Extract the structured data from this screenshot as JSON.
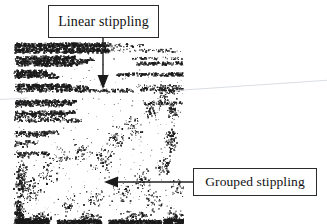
{
  "figure": {
    "width": 327,
    "height": 224,
    "background_color": "#ffffff",
    "ink_color": "#1a1a1a",
    "streak_color": "#d9dde2"
  },
  "annotations": [
    {
      "id": "linear",
      "label": "Linear stippling",
      "box": {
        "x": 48,
        "y": 5,
        "width": 111,
        "height": 33
      },
      "border_color": "#2b2b2b",
      "arrow": {
        "direction": "down",
        "from": {
          "x": 103,
          "y": 38
        },
        "to": {
          "x": 103,
          "y": 88
        }
      }
    },
    {
      "id": "grouped",
      "label": "Grouped stippling",
      "box": {
        "x": 193,
        "y": 168,
        "width": 124,
        "height": 28
      },
      "border_color": "#2b2b2b",
      "arrow": {
        "direction": "left",
        "from": {
          "x": 193,
          "y": 182
        },
        "to": {
          "x": 104,
          "y": 182
        }
      }
    }
  ],
  "scan": {
    "region": {
      "x": 12,
      "y": 39,
      "width": 172,
      "height": 185
    },
    "seed": 20240517,
    "linear_rows": [
      {
        "y": 3,
        "x": 2,
        "width": 96,
        "density": 0.5,
        "size": 1.5
      },
      {
        "y": 5,
        "x": 2,
        "width": 92,
        "density": 0.46,
        "size": 1.4
      },
      {
        "y": 8,
        "x": 2,
        "width": 99,
        "density": 0.52,
        "size": 1.5
      },
      {
        "y": 10,
        "x": 2,
        "width": 94,
        "density": 0.44,
        "size": 1.4
      },
      {
        "y": 4,
        "x": 101,
        "width": 30,
        "density": 0.16,
        "size": 1.2
      },
      {
        "y": 9,
        "x": 100,
        "width": 70,
        "density": 0.14,
        "size": 1.2
      },
      {
        "y": 16,
        "x": 2,
        "width": 60,
        "density": 0.48,
        "size": 1.5
      },
      {
        "y": 18,
        "x": 2,
        "width": 78,
        "density": 0.46,
        "size": 1.4
      },
      {
        "y": 21,
        "x": 2,
        "width": 72,
        "density": 0.5,
        "size": 1.5
      },
      {
        "y": 23,
        "x": 2,
        "width": 64,
        "density": 0.42,
        "size": 1.4
      },
      {
        "y": 17,
        "x": 118,
        "width": 52,
        "density": 0.18,
        "size": 1.2
      },
      {
        "y": 22,
        "x": 122,
        "width": 48,
        "density": 0.4,
        "size": 1.4
      },
      {
        "y": 30,
        "x": 2,
        "width": 32,
        "density": 0.5,
        "size": 1.5
      },
      {
        "y": 33,
        "x": 2,
        "width": 40,
        "density": 0.48,
        "size": 1.5
      },
      {
        "y": 35,
        "x": 2,
        "width": 44,
        "density": 0.4,
        "size": 1.3
      },
      {
        "y": 33,
        "x": 104,
        "width": 66,
        "density": 0.42,
        "size": 1.4
      },
      {
        "y": 44,
        "x": 2,
        "width": 56,
        "density": 0.48,
        "size": 1.5
      },
      {
        "y": 46,
        "x": 2,
        "width": 74,
        "density": 0.46,
        "size": 1.4
      },
      {
        "y": 49,
        "x": 2,
        "width": 120,
        "density": 0.34,
        "size": 1.3
      },
      {
        "y": 45,
        "x": 124,
        "width": 46,
        "density": 0.22,
        "size": 1.2
      },
      {
        "y": 48,
        "x": 128,
        "width": 42,
        "density": 0.4,
        "size": 1.4
      },
      {
        "y": 52,
        "x": 140,
        "width": 26,
        "density": 0.18,
        "size": 1.1
      },
      {
        "y": 60,
        "x": 2,
        "width": 62,
        "density": 0.46,
        "size": 1.4
      },
      {
        "y": 62,
        "x": 2,
        "width": 58,
        "density": 0.44,
        "size": 1.4
      },
      {
        "y": 64,
        "x": 2,
        "width": 48,
        "density": 0.3,
        "size": 1.2
      },
      {
        "y": 62,
        "x": 130,
        "width": 40,
        "density": 0.26,
        "size": 1.3
      },
      {
        "y": 71,
        "x": 2,
        "width": 60,
        "density": 0.42,
        "size": 1.4
      },
      {
        "y": 73,
        "x": 2,
        "width": 54,
        "density": 0.4,
        "size": 1.4
      },
      {
        "y": 76,
        "x": 2,
        "width": 50,
        "density": 0.26,
        "size": 1.2
      },
      {
        "y": 79,
        "x": 2,
        "width": 66,
        "density": 0.3,
        "size": 1.3
      },
      {
        "y": 91,
        "x": 2,
        "width": 44,
        "density": 0.4,
        "size": 1.4
      },
      {
        "y": 94,
        "x": 2,
        "width": 34,
        "density": 0.3,
        "size": 1.3
      },
      {
        "y": 101,
        "x": 2,
        "width": 22,
        "density": 0.34,
        "size": 1.3
      },
      {
        "y": 104,
        "x": 2,
        "width": 14,
        "density": 0.26,
        "size": 1.2
      },
      {
        "y": 112,
        "x": 2,
        "width": 34,
        "density": 0.38,
        "size": 1.4
      },
      {
        "y": 115,
        "x": 2,
        "width": 16,
        "density": 0.26,
        "size": 1.2
      }
    ],
    "clusters": [
      {
        "cx": 8,
        "cy": 140,
        "rx": 9,
        "ry": 28,
        "count": 150,
        "size": 1.3
      },
      {
        "cx": 6,
        "cy": 172,
        "rx": 8,
        "ry": 24,
        "count": 170,
        "size": 1.4
      },
      {
        "cx": 20,
        "cy": 150,
        "rx": 14,
        "ry": 20,
        "count": 70,
        "size": 1.2
      },
      {
        "cx": 34,
        "cy": 132,
        "rx": 18,
        "ry": 22,
        "count": 55,
        "size": 1.2
      },
      {
        "cx": 48,
        "cy": 118,
        "rx": 16,
        "ry": 16,
        "count": 40,
        "size": 1.2
      },
      {
        "cx": 68,
        "cy": 112,
        "rx": 18,
        "ry": 18,
        "count": 45,
        "size": 1.2
      },
      {
        "cx": 90,
        "cy": 120,
        "rx": 20,
        "ry": 22,
        "count": 60,
        "size": 1.3
      },
      {
        "cx": 104,
        "cy": 100,
        "rx": 16,
        "ry": 20,
        "count": 55,
        "size": 1.2
      },
      {
        "cx": 120,
        "cy": 88,
        "rx": 14,
        "ry": 18,
        "count": 50,
        "size": 1.2
      },
      {
        "cx": 138,
        "cy": 72,
        "rx": 12,
        "ry": 16,
        "count": 48,
        "size": 1.2
      },
      {
        "cx": 150,
        "cy": 58,
        "rx": 10,
        "ry": 14,
        "count": 42,
        "size": 1.2
      },
      {
        "cx": 160,
        "cy": 70,
        "rx": 9,
        "ry": 18,
        "count": 60,
        "size": 1.3
      },
      {
        "cx": 158,
        "cy": 100,
        "rx": 10,
        "ry": 20,
        "count": 70,
        "size": 1.3
      },
      {
        "cx": 150,
        "cy": 126,
        "rx": 12,
        "ry": 16,
        "count": 55,
        "size": 1.3
      },
      {
        "cx": 130,
        "cy": 140,
        "rx": 16,
        "ry": 18,
        "count": 50,
        "size": 1.2
      },
      {
        "cx": 108,
        "cy": 152,
        "rx": 18,
        "ry": 18,
        "count": 45,
        "size": 1.2
      },
      {
        "cx": 80,
        "cy": 158,
        "rx": 18,
        "ry": 16,
        "count": 40,
        "size": 1.2
      },
      {
        "cx": 56,
        "cy": 166,
        "rx": 16,
        "ry": 14,
        "count": 38,
        "size": 1.2
      },
      {
        "cx": 140,
        "cy": 160,
        "rx": 16,
        "ry": 14,
        "count": 42,
        "size": 1.2
      },
      {
        "cx": 164,
        "cy": 150,
        "rx": 10,
        "ry": 14,
        "count": 38,
        "size": 1.2
      },
      {
        "cx": 30,
        "cy": 178,
        "rx": 20,
        "ry": 8,
        "count": 80,
        "size": 1.3
      },
      {
        "cx": 76,
        "cy": 178,
        "rx": 22,
        "ry": 8,
        "count": 70,
        "size": 1.3
      },
      {
        "cx": 126,
        "cy": 176,
        "rx": 22,
        "ry": 8,
        "count": 65,
        "size": 1.3
      },
      {
        "cx": 162,
        "cy": 176,
        "rx": 14,
        "ry": 9,
        "count": 55,
        "size": 1.3
      }
    ],
    "dense_bands": [
      {
        "x": 2,
        "y": 179,
        "width": 34,
        "height": 6,
        "density": 0.62,
        "size": 1.5
      },
      {
        "x": 44,
        "y": 180,
        "width": 44,
        "height": 5,
        "density": 0.5,
        "size": 1.4
      },
      {
        "x": 96,
        "y": 180,
        "width": 52,
        "height": 5,
        "density": 0.48,
        "size": 1.4
      },
      {
        "x": 150,
        "y": 179,
        "width": 22,
        "height": 6,
        "density": 0.55,
        "size": 1.5
      }
    ],
    "sparse_speckle": {
      "count": 260,
      "size": 1.1
    }
  }
}
